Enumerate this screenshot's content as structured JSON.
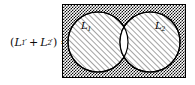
{
  "figure": {
    "background_color": "#ffffff",
    "width": 195,
    "height": 85
  },
  "equation": {
    "open_paren": "(",
    "term1_var": "L",
    "term1_subscript": "1",
    "term1_prime": "′",
    "operator": "+",
    "term2_var": "L",
    "term2_subscript": "2",
    "term2_prime": "′",
    "close_paren": ")",
    "equals": "=",
    "plain_text": "(L₁′ + L₂′) ="
  },
  "diagram": {
    "universe": {
      "label": "universe-rectangle",
      "fill_pattern": "checkerboard-dither",
      "fill_color": "#101010",
      "border_color": "#000000",
      "border_width": 1,
      "x": 62,
      "y": 4,
      "width": 124,
      "height": 74
    },
    "circles": [
      {
        "name": "L1",
        "label_var": "L",
        "label_subscript": "1",
        "cx": 98,
        "cy": 42,
        "r": 30,
        "fill_pattern": "diagonal-hatch",
        "fill_color": "#b9b9b9",
        "stroke_color": "#000000"
      },
      {
        "name": "L2",
        "label_var": "L",
        "label_subscript": "2",
        "cx": 150,
        "cy": 42,
        "r": 30,
        "fill_pattern": "diagonal-hatch",
        "fill_color": "#b9b9b9",
        "stroke_color": "#000000"
      }
    ],
    "intersection": {
      "name": "lens-intersection",
      "fill": "white",
      "fill_color": "#ffffff",
      "description": "unshaded lens region"
    }
  }
}
